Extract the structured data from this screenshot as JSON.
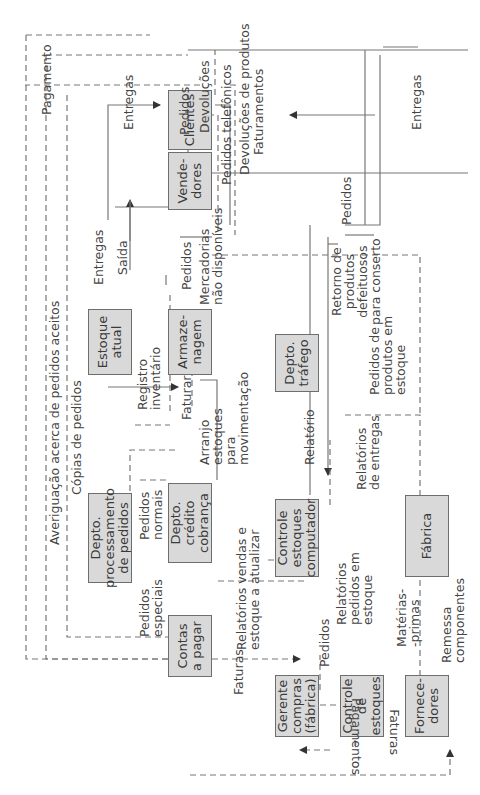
{
  "diagram": {
    "boxes": {
      "contas_a_pagar": "Contas\na pagar",
      "gerente_compras": "Gerente\ncompras\n(fábrica)",
      "controle_de_estoques": "Controle de\nestoques",
      "fornecedores": "Fornece-\ndores",
      "depto_processamento": "Depto.\nprocessamento\nde pedidos",
      "depto_credito": "Depto.\ncrédito\ncobrança",
      "controle_estoques_computador": "Controle\nestoques\ncomputador",
      "fabrica": "Fábrica",
      "depto_trafego": "Depto.\ntráfego",
      "estoque_atual": "Estoque\natual",
      "armazenagem": "Armaze-\nnagem",
      "vendedores": "Vende-\ndores",
      "clientes": "Clientes"
    },
    "labels": {
      "pagamentos": "Pagamentos",
      "faturas_top": "Faturas",
      "faturas_left": "Faturas",
      "pedidos_gerente": "Pedidos",
      "materias_primas": "Matérias-\n-primas",
      "remessa_componentes": "Remessa\ncomponentes",
      "relatorios_vendas": "Relatórios vendas e\nestoque a atualizar",
      "relatorios_pedidos_estoque": "Relatórios\npedidos em\nestoque",
      "relatorios_entregas": "Relatórios\nde entregas",
      "relatorio": "Relatório",
      "pedidos_especiais": "Pedidos\nespeciais",
      "pedidos_normais": "Pedidos\nnormais",
      "averiguacao": "Averiguação acerca de pedidos aceitos",
      "copias_pedidos": "Cópias de pedidos",
      "registro_inventario": "Registro\ninventário",
      "faturar": "Faturar",
      "arranjo_estoques": "Arranjo\nestoques\npara\nmovimentação",
      "pedidos_produtos_estoque": "Pedidos de\nprodutos em\nestoque",
      "retorno_produtos": "Retorno de\nprodutos\ndefeituosos\npara conserto",
      "entregas_estoque": "Entregas",
      "saida": "Saída",
      "pedidos_vend_armaz": "Pedidos",
      "mercadorias_nao_disponiveis": "Mercadorias\nnão disponíveis",
      "pagamento": "Pagamento",
      "entregas_clientes": "Entregas",
      "pedidos_cli_vend": "Pedidos",
      "devolucoes": "Devoluções",
      "pedidos_telefonicos": "Pedidos telefônicos",
      "devolucoes_produtos": "Devoluções de produtos",
      "faturamentos": "Faturamentos",
      "pedidos_vend_fabrica": "Pedidos",
      "entregas_fabrica": "Entregas"
    }
  }
}
